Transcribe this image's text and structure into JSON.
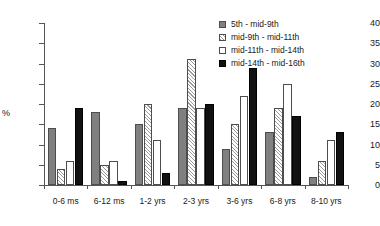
{
  "chart_data": {
    "type": "bar",
    "title": "",
    "subtitle": "",
    "xlabel": "",
    "ylabel": "%",
    "ylim": [
      0,
      40
    ],
    "yticks": [
      0,
      5,
      10,
      15,
      20,
      25,
      30,
      35,
      40
    ],
    "grid": false,
    "legend_position": "top-right",
    "categories": [
      "0-6 ms",
      "6-12 ms",
      "1-2 yrs",
      "2-3 yrs",
      "3-6 yrs",
      "6-8 yrs",
      "8-10 yrs"
    ],
    "series": [
      {
        "name": "5th - mid-9th",
        "color": "#808080",
        "pattern": "solid",
        "values": [
          14,
          18,
          15,
          19,
          9,
          13,
          2
        ]
      },
      {
        "name": "mid-9th - mid-11th",
        "color": "#ffffff",
        "pattern": "hatch",
        "values": [
          4,
          5,
          20,
          31,
          15,
          19,
          6
        ]
      },
      {
        "name": "mid-11th - mid-14th",
        "color": "#ffffff",
        "pattern": "open",
        "values": [
          6,
          6,
          11,
          19,
          22,
          25,
          11
        ]
      },
      {
        "name": "mid-14th - mid-16th",
        "color": "#111111",
        "pattern": "solid",
        "values": [
          19,
          1,
          3,
          20,
          29,
          17,
          13
        ]
      }
    ]
  },
  "legend": {
    "items": [
      {
        "label": "5th - mid-9th"
      },
      {
        "label": "mid-9th - mid-11th"
      },
      {
        "label": "mid-11th - mid-14th"
      },
      {
        "label": "mid-14th - mid-16th"
      }
    ]
  }
}
